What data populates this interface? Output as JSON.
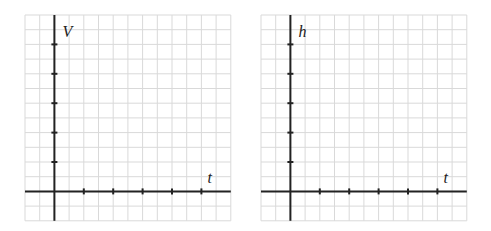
{
  "graphs": [
    {
      "id": "volume-graph",
      "y_label": "V",
      "x_label": "t",
      "grid": {
        "left": 25,
        "top": 15,
        "cols": 14,
        "rows": 14,
        "cell": 14.7
      },
      "origin_col": 2,
      "origin_row": 12,
      "y_ticks": 5,
      "x_ticks": 5,
      "tick_spacing_cells": 2
    },
    {
      "id": "height-graph",
      "y_label": "h",
      "x_label": "t",
      "grid": {
        "left": 261,
        "top": 15,
        "cols": 14,
        "rows": 14,
        "cell": 14.7
      },
      "origin_col": 2,
      "origin_row": 12,
      "y_ticks": 5,
      "x_ticks": 5,
      "tick_spacing_cells": 2
    }
  ],
  "colors": {
    "grid": "#d9d9d9",
    "axis": "#222222",
    "background": "#ffffff"
  }
}
